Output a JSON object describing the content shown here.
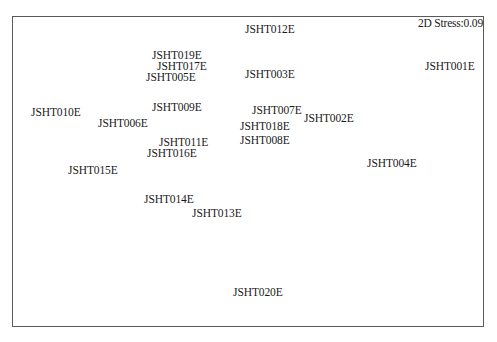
{
  "chart_data": {
    "type": "scatter",
    "title": "",
    "subtitle": "",
    "xlabel": "",
    "ylabel": "",
    "grid": false,
    "legend": null,
    "marker": "text-label-only",
    "annotations": [
      {
        "text": "2D Stress:0.09",
        "position": "top-right"
      }
    ],
    "stress": 0.09,
    "points": [
      {
        "label": "JSHT012E",
        "x": 245,
        "y": 25
      },
      {
        "label": "JSHT019E",
        "x": 152,
        "y": 51
      },
      {
        "label": "JSHT017E",
        "x": 157,
        "y": 62
      },
      {
        "label": "JSHT001E",
        "x": 425,
        "y": 62
      },
      {
        "label": "JSHT005E",
        "x": 146,
        "y": 73
      },
      {
        "label": "JSHT003E",
        "x": 245,
        "y": 70
      },
      {
        "label": "JSHT009E",
        "x": 152,
        "y": 103
      },
      {
        "label": "JSHT010E",
        "x": 31,
        "y": 108
      },
      {
        "label": "JSHT007E",
        "x": 252,
        "y": 106
      },
      {
        "label": "JSHT002E",
        "x": 304,
        "y": 114
      },
      {
        "label": "JSHT006E",
        "x": 98,
        "y": 119
      },
      {
        "label": "JSHT018E",
        "x": 240,
        "y": 122
      },
      {
        "label": "JSHT008E",
        "x": 240,
        "y": 136
      },
      {
        "label": "JSHT011E",
        "x": 159,
        "y": 138
      },
      {
        "label": "JSHT016E",
        "x": 147,
        "y": 149
      },
      {
        "label": "JSHT004E",
        "x": 367,
        "y": 159
      },
      {
        "label": "JSHT015E",
        "x": 68,
        "y": 166
      },
      {
        "label": "JSHT014E",
        "x": 144,
        "y": 195
      },
      {
        "label": "JSHT013E",
        "x": 192,
        "y": 209
      },
      {
        "label": "JSHT020E",
        "x": 233,
        "y": 288
      }
    ],
    "coordinate_note": "x/y are pixel positions of label top-left within the 497x342 image; NMDS axes have no ticks or scales"
  },
  "stress_label": "2D Stress:0.09"
}
